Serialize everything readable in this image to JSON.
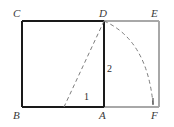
{
  "figure": {
    "vertex_labels": [
      {
        "id": "C",
        "text": "C",
        "x": 22,
        "y": 21
      },
      {
        "id": "D",
        "text": "D",
        "x": 104,
        "y": 21
      },
      {
        "id": "E",
        "text": "E",
        "x": 159,
        "y": 21
      },
      {
        "id": "B",
        "text": "B",
        "x": 22,
        "y": 107
      },
      {
        "id": "A",
        "text": "A",
        "x": 104,
        "y": 107
      },
      {
        "id": "F",
        "text": "F",
        "x": 159,
        "y": 107
      }
    ],
    "measure_labels": [
      {
        "id": "seg-1",
        "text": "1"
      },
      {
        "id": "seg-2",
        "text": "2"
      }
    ],
    "colors": {
      "square_stroke": "#1a1a1a",
      "extension_stroke": "#a8a8a8",
      "dashed_stroke": "#7d7d7d",
      "label_text": "#3a3a3a",
      "background": "#ffffff"
    },
    "geometry": {
      "square": {
        "left": 22,
        "top": 21,
        "right": 104,
        "bottom": 107
      },
      "rectangle_right_edge": 159,
      "diagonal_dashed": {
        "x1": 104,
        "y1": 21,
        "x2": 64,
        "y2": 107
      },
      "arc_dashed": {
        "start_x": 104,
        "start_y": 21,
        "end_x": 153,
        "end_y": 104
      }
    }
  }
}
